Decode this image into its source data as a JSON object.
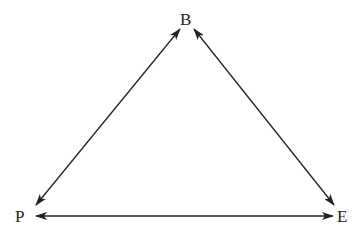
{
  "diagram": {
    "type": "triangle-relationship",
    "nodes": [
      {
        "id": "B",
        "label": "B"
      },
      {
        "id": "P",
        "label": "P"
      },
      {
        "id": "E",
        "label": "E"
      }
    ],
    "edges": [
      {
        "from": "P",
        "to": "B",
        "direction": "bidirectional"
      },
      {
        "from": "B",
        "to": "E",
        "direction": "bidirectional"
      },
      {
        "from": "P",
        "to": "E",
        "direction": "bidirectional"
      }
    ],
    "colors": {
      "line": "#222222",
      "text": "#222222"
    }
  }
}
